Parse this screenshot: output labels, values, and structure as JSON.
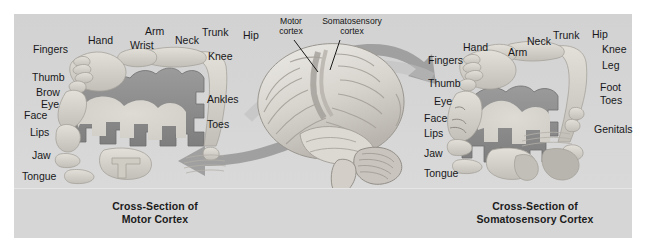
{
  "figure": {
    "background_color": "#d4d4d4",
    "page_color": "#ffffff",
    "cortex_ribbon_color": "#8a8a8a",
    "body_figure_color": "#c9c6c0",
    "arrow_color": "#9a9a9a",
    "label_color": "#18181a"
  },
  "left_panel": {
    "caption_line1": "Cross-Section of",
    "caption_line2": "Motor Cortex",
    "top_labels": [
      {
        "text": "Fingers",
        "x": 33,
        "y": 44
      },
      {
        "text": "Hand",
        "x": 88,
        "y": 35
      },
      {
        "text": "Wrist",
        "x": 130,
        "y": 40
      },
      {
        "text": "Arm",
        "x": 145,
        "y": 26
      },
      {
        "text": "Neck",
        "x": 175,
        "y": 35
      },
      {
        "text": "Trunk",
        "x": 202,
        "y": 27
      },
      {
        "text": "Hip",
        "x": 243,
        "y": 30
      }
    ],
    "right_labels": [
      {
        "text": "Knee",
        "x": 208,
        "y": 51
      },
      {
        "text": "Ankles",
        "x": 207,
        "y": 94
      },
      {
        "text": "Toes",
        "x": 207,
        "y": 119
      }
    ],
    "face_labels": [
      {
        "text": "Thumb",
        "x": 32,
        "y": 72
      },
      {
        "text": "Brow",
        "x": 36,
        "y": 87
      },
      {
        "text": "Eye",
        "x": 41,
        "y": 99
      },
      {
        "text": "Face",
        "x": 24,
        "y": 110
      },
      {
        "text": "Lips",
        "x": 30,
        "y": 127
      },
      {
        "text": "Jaw",
        "x": 32,
        "y": 150
      },
      {
        "text": "Tongue",
        "x": 22,
        "y": 171
      }
    ]
  },
  "center": {
    "labels": [
      {
        "text_line1": "Motor",
        "text_line2": "cortex",
        "x": 277,
        "y": 18
      },
      {
        "text_line1": "Somatosensory",
        "text_line2": "cortex",
        "x": 322,
        "y": 18
      }
    ],
    "brain_description": "lateral view of human brain with cerebellum and brainstem"
  },
  "right_panel": {
    "caption_line1": "Cross-Section of",
    "caption_line2": "Somatosensory Cortex",
    "top_labels": [
      {
        "text": "Fingers",
        "x": 428,
        "y": 55
      },
      {
        "text": "Hand",
        "x": 463,
        "y": 42
      },
      {
        "text": "Arm",
        "x": 508,
        "y": 47
      },
      {
        "text": "Neck",
        "x": 527,
        "y": 36
      },
      {
        "text": "Trunk",
        "x": 553,
        "y": 30
      },
      {
        "text": "Hip",
        "x": 592,
        "y": 29
      }
    ],
    "right_labels": [
      {
        "text": "Knee",
        "x": 602,
        "y": 44
      },
      {
        "text": "Leg",
        "x": 602,
        "y": 60
      },
      {
        "text": "Foot",
        "x": 600,
        "y": 82
      },
      {
        "text": "Toes",
        "x": 600,
        "y": 95
      },
      {
        "text": "Genitals",
        "x": 594,
        "y": 124
      }
    ],
    "face_labels": [
      {
        "text": "Thumb",
        "x": 428,
        "y": 78
      },
      {
        "text": "Eye",
        "x": 434,
        "y": 96
      },
      {
        "text": "Face",
        "x": 424,
        "y": 113
      },
      {
        "text": "Lips",
        "x": 424,
        "y": 128
      },
      {
        "text": "Jaw",
        "x": 424,
        "y": 148
      },
      {
        "text": "Tongue",
        "x": 424,
        "y": 168
      }
    ]
  }
}
